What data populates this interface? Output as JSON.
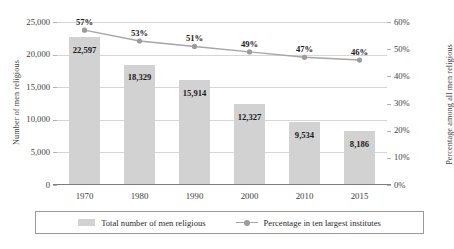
{
  "chart_data": {
    "type": "bar",
    "title": "",
    "categories": [
      "1970",
      "1980",
      "1990",
      "2000",
      "2010",
      "2015"
    ],
    "xlabel": "",
    "ylabel": "Number of men religious",
    "ylabel_secondary": "Percentage among all men religious",
    "ylim": [
      0,
      25000
    ],
    "ylim_secondary": [
      0,
      60
    ],
    "grid": true,
    "legend_position": "bottom",
    "series": [
      {
        "name": "Total number of men religious",
        "type": "bar",
        "axis": "left",
        "color": "#d2d2d2",
        "values": [
          22597,
          18329,
          15914,
          12327,
          9534,
          8186
        ],
        "value_labels": [
          "22,597",
          "18,329",
          "15,914",
          "12,327",
          "9,534",
          "8,186"
        ]
      },
      {
        "name": "Percentage in ten largest institutes",
        "type": "line",
        "axis": "right",
        "color": "#a6a6a6",
        "values": [
          57,
          53,
          51,
          49,
          47,
          46
        ],
        "value_labels": [
          "57%",
          "53%",
          "51%",
          "49%",
          "47%",
          "46%"
        ]
      }
    ],
    "yticks_left": [
      "0",
      "5,000",
      "10,000",
      "15,000",
      "20,000",
      "25,000"
    ],
    "yticks_left_values": [
      0,
      5000,
      10000,
      15000,
      20000,
      25000
    ],
    "yticks_right": [
      "0%",
      "10%",
      "20%",
      "30%",
      "40%",
      "50%",
      "60%"
    ],
    "yticks_right_values": [
      0,
      10,
      20,
      30,
      40,
      50,
      60
    ]
  },
  "axes": {
    "left_title": "Number of men religious",
    "right_title": "Percentage among all men religious"
  },
  "legend": {
    "items": [
      {
        "label": "Total number of men religious",
        "marker": "bar-swatch-icon",
        "color": "#d2d2d2"
      },
      {
        "label": "Percentage in ten largest institutes",
        "marker": "line-marker-icon",
        "color": "#a6a6a6"
      }
    ]
  }
}
